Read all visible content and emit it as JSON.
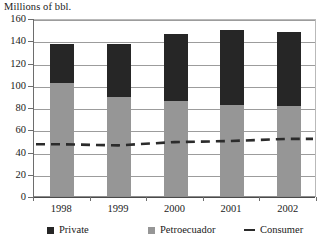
{
  "chart_data": {
    "type": "bar",
    "stacked": true,
    "title": "Millions of bbl.",
    "xlabel": "",
    "ylabel": "Millions of bbl.",
    "categories": [
      "1998",
      "1999",
      "2000",
      "2001",
      "2002"
    ],
    "ylim": [
      0,
      160
    ],
    "yticks": [
      0,
      20,
      40,
      60,
      80,
      100,
      120,
      140,
      160
    ],
    "ytick_labels": [
      "0",
      "20",
      "40",
      "60",
      "80",
      "100",
      "120",
      "140",
      "160"
    ],
    "grid": true,
    "legend_position": "bottom",
    "series": [
      {
        "name": "Petroecuador",
        "type": "bar",
        "color": "#969696",
        "values": [
          102,
          89,
          85,
          82,
          81
        ]
      },
      {
        "name": "Private",
        "type": "bar",
        "color": "#262626",
        "values": [
          35,
          48,
          61,
          67,
          66
        ]
      },
      {
        "name": "Consumer",
        "type": "line",
        "style": "dashed",
        "color": "#2b2b2b",
        "values": [
          47,
          46,
          49,
          50,
          52
        ]
      }
    ],
    "totals": [
      137,
      137,
      146,
      149,
      147
    ],
    "legend": [
      {
        "label": "Private",
        "marker": "square",
        "color": "#262626"
      },
      {
        "label": "Petroecuador",
        "marker": "square",
        "color": "#969696"
      },
      {
        "label": "Consumer",
        "marker": "dashed-line",
        "color": "#2b2b2b"
      }
    ]
  },
  "axis_title": "Millions of bbl.",
  "colors": {
    "private": "#262626",
    "petroecuador": "#969696",
    "consumer": "#2b2b2b",
    "grid": "#9c9c9c",
    "axis": "#6d6d6d",
    "background": "#ffffff"
  }
}
